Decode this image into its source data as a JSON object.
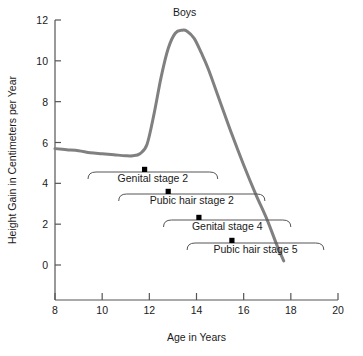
{
  "chart_data": {
    "type": "line",
    "title": "Boys",
    "xlabel": "Age in Years",
    "ylabel": "Height Gain in Centimeters per Year",
    "xlim": [
      8,
      20
    ],
    "ylim": [
      0,
      12
    ],
    "xticks": [
      8,
      10,
      12,
      14,
      16,
      18,
      20
    ],
    "yticks": [
      0,
      2,
      4,
      6,
      8,
      10,
      12
    ],
    "xtick_labels": [
      "8",
      "10",
      "12",
      "14",
      "16",
      "18",
      "20"
    ],
    "ytick_labels": [
      "0",
      "2",
      "4",
      "6",
      "8",
      "10",
      "12"
    ],
    "grid": false,
    "legend": "none",
    "series": [
      {
        "name": "Height velocity (boys)",
        "color": "#808080",
        "x": [
          8.0,
          8.5,
          9.0,
          9.5,
          10.0,
          10.5,
          11.0,
          11.3,
          11.6,
          11.9,
          12.2,
          12.5,
          12.8,
          13.1,
          13.4,
          13.6,
          13.9,
          14.2,
          14.5,
          15.0,
          15.5,
          16.0,
          16.5,
          17.0,
          17.4,
          17.7
        ],
        "y": [
          5.7,
          5.65,
          5.6,
          5.5,
          5.45,
          5.4,
          5.35,
          5.35,
          5.45,
          5.9,
          7.4,
          9.2,
          10.6,
          11.35,
          11.5,
          11.45,
          11.1,
          10.4,
          9.6,
          8.0,
          6.4,
          4.9,
          3.5,
          2.2,
          1.0,
          0.2
        ]
      }
    ],
    "annotations": [
      {
        "label": "Genital stage 2",
        "bracket_start_age": 9.4,
        "bracket_end_age": 14.9,
        "marker_age": 11.8,
        "row": 1
      },
      {
        "label": "Pubic hair stage 2",
        "bracket_start_age": 10.7,
        "bracket_end_age": 16.9,
        "marker_age": 12.8,
        "row": 2
      },
      {
        "label": "Genital stage 4",
        "bracket_start_age": 12.6,
        "bracket_end_age": 18.0,
        "marker_age": 14.1,
        "row": 3
      },
      {
        "label": "Pubic hair stage 5",
        "bracket_start_age": 13.6,
        "bracket_end_age": 19.4,
        "marker_age": 15.5,
        "row": 4
      }
    ],
    "colors": {
      "curve": "#808080",
      "axis": "#555555",
      "marker": "#000000",
      "text": "#1a1a1a",
      "background": "#ffffff"
    }
  }
}
